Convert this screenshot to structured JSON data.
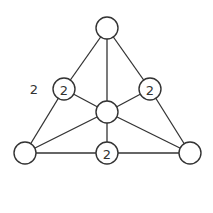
{
  "diagram": {
    "type": "graph",
    "colors": {
      "stroke": "#333333",
      "background": "#ffffff"
    },
    "node_radius": 11,
    "nodes": [
      {
        "id": "top",
        "x": 107,
        "y": 28,
        "label": ""
      },
      {
        "id": "left_mid",
        "x": 64,
        "y": 89,
        "label": "2"
      },
      {
        "id": "right_mid",
        "x": 150,
        "y": 89,
        "label": "2"
      },
      {
        "id": "center",
        "x": 107,
        "y": 112,
        "label": ""
      },
      {
        "id": "bottom_left",
        "x": 25,
        "y": 153,
        "label": ""
      },
      {
        "id": "bottom_mid",
        "x": 107,
        "y": 153,
        "label": "2"
      },
      {
        "id": "bottom_right",
        "x": 190,
        "y": 153,
        "label": ""
      }
    ],
    "edges": [
      [
        "top",
        "left_mid"
      ],
      [
        "left_mid",
        "bottom_left"
      ],
      [
        "top",
        "center"
      ],
      [
        "top",
        "right_mid"
      ],
      [
        "right_mid",
        "bottom_right"
      ],
      [
        "left_mid",
        "center"
      ],
      [
        "right_mid",
        "center"
      ],
      [
        "center",
        "bottom_left"
      ],
      [
        "center",
        "bottom_right"
      ],
      [
        "center",
        "bottom_mid"
      ],
      [
        "bottom_left",
        "bottom_mid"
      ],
      [
        "bottom_mid",
        "bottom_right"
      ]
    ],
    "free_labels": [
      {
        "text": "2",
        "x": 34,
        "y": 89
      }
    ]
  }
}
